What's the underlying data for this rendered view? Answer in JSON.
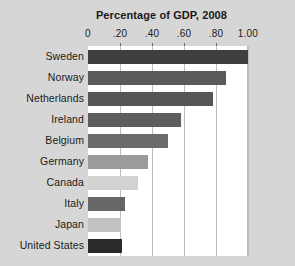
{
  "chart_data": {
    "type": "bar",
    "orientation": "horizontal",
    "title": "Percentage of GDP, 2008",
    "xlabel": "",
    "ylabel": "",
    "xlim": [
      0,
      1.0
    ],
    "grid": true,
    "legend": null,
    "xticks": [
      {
        "value": 0,
        "label": "0"
      },
      {
        "value": 0.2,
        "label": ".20"
      },
      {
        "value": 0.4,
        "label": ".40"
      },
      {
        "value": 0.6,
        "label": ".60"
      },
      {
        "value": 0.8,
        "label": ".80"
      },
      {
        "value": 1.0,
        "label": "1.00"
      }
    ],
    "categories": [
      "Sweden",
      "Norway",
      "Netherlands",
      "Ireland",
      "Belgium",
      "Germany",
      "Canada",
      "Italy",
      "Japan",
      "United States"
    ],
    "values": [
      1.0,
      0.86,
      0.78,
      0.58,
      0.5,
      0.375,
      0.31,
      0.23,
      0.205,
      0.215
    ],
    "bar_colors": [
      "#3f3f3f",
      "#5a5a5a",
      "#565656",
      "#5e5e5e",
      "#6b6b6b",
      "#9b9b9b",
      "#d2d2d2",
      "#666666",
      "#c2c2c2",
      "#2a2a2a"
    ]
  },
  "colors": {
    "page_background": "#d6d6d6",
    "plot_background": "#ffffff",
    "gridline": "#bdbdbd",
    "text": "#1a1a1a",
    "tick_mark": "#6e6e6e"
  }
}
